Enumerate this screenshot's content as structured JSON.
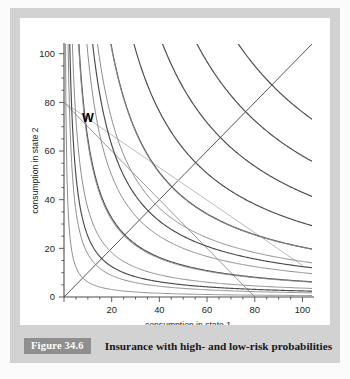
{
  "figure": {
    "caption_badge": "Figure 34.6",
    "caption_text": "Insurance with high- and low-risk probabilities",
    "badge_color": "#8f8f8f"
  },
  "chart_data": {
    "type": "line",
    "title": "",
    "xlabel": "consumption in state 1",
    "ylabel": "consumption in state 2",
    "xlim": [
      0,
      104
    ],
    "ylim": [
      0,
      104
    ],
    "xticks": [
      0,
      20,
      40,
      60,
      80,
      100
    ],
    "xtick_labels": [
      "",
      "20",
      "40",
      "60",
      "80",
      "100"
    ],
    "yticks": [
      0,
      20,
      40,
      60,
      80,
      100
    ],
    "ytick_labels": [
      "0",
      "20",
      "40",
      "60",
      "80",
      "100"
    ],
    "grid": false,
    "legend": false,
    "annotations": [
      {
        "text": "W",
        "x": 10,
        "y": 72,
        "label": "endowment-point-W"
      }
    ],
    "series": [
      {
        "name": "certainty-line-45deg",
        "type": "line",
        "color": "#555555",
        "width": 1.0,
        "points": [
          [
            0,
            0
          ],
          [
            104,
            104
          ]
        ]
      },
      {
        "name": "high-risk-budget-line",
        "type": "line",
        "color": "#9a9a9a",
        "width": 1.0,
        "points": [
          [
            0,
            80
          ],
          [
            80,
            0
          ]
        ]
      },
      {
        "name": "low-risk-budget-line",
        "type": "line",
        "color": "#bcbcbc",
        "width": 1.0,
        "points": [
          [
            0,
            80
          ],
          [
            100,
            13
          ]
        ]
      },
      {
        "name": "indifference-curve-dark-1",
        "type": "hyperbola",
        "color": "#4a4a4a",
        "width": 1.15,
        "k": 250,
        "slope": 1.0
      },
      {
        "name": "indifference-curve-dark-2",
        "type": "hyperbola",
        "color": "#4a4a4a",
        "width": 1.15,
        "k": 650,
        "slope": 1.0
      },
      {
        "name": "indifference-curve-dark-3",
        "type": "hyperbola",
        "color": "#4a4a4a",
        "width": 1.15,
        "k": 1250,
        "slope": 1.0
      },
      {
        "name": "indifference-curve-dark-4",
        "type": "hyperbola",
        "color": "#4a4a4a",
        "width": 1.15,
        "k": 2050,
        "slope": 1.0
      },
      {
        "name": "indifference-curve-dark-5",
        "type": "hyperbola",
        "color": "#4a4a4a",
        "width": 1.15,
        "k": 3050,
        "slope": 1.0
      },
      {
        "name": "indifference-curve-dark-6",
        "type": "hyperbola",
        "color": "#4a4a4a",
        "width": 1.15,
        "k": 4300,
        "slope": 1.0
      },
      {
        "name": "indifference-curve-dark-7",
        "type": "hyperbola",
        "color": "#4a4a4a",
        "width": 1.15,
        "k": 5800,
        "slope": 1.0
      },
      {
        "name": "indifference-curve-dark-8",
        "type": "hyperbola",
        "color": "#4a4a4a",
        "width": 1.15,
        "k": 7600,
        "slope": 1.0
      },
      {
        "name": "indifference-curve-light-1",
        "type": "hyperbola",
        "color": "#8d8d8d",
        "width": 1.0,
        "k": 160,
        "slope": 2.6
      },
      {
        "name": "indifference-curve-light-2",
        "type": "hyperbola",
        "color": "#8d8d8d",
        "width": 1.0,
        "k": 460,
        "slope": 2.6
      },
      {
        "name": "indifference-curve-light-3",
        "type": "hyperbola",
        "color": "#8d8d8d",
        "width": 1.0,
        "k": 950,
        "slope": 2.6
      },
      {
        "name": "indifference-curve-light-4",
        "type": "hyperbola",
        "color": "#8d8d8d",
        "width": 1.0,
        "k": 1650,
        "slope": 2.6
      },
      {
        "name": "indifference-curve-light-5",
        "type": "hyperbola",
        "color": "#8d8d8d",
        "width": 1.0,
        "k": 2600,
        "slope": 2.6
      },
      {
        "name": "indifference-curve-light-6",
        "type": "hyperbola",
        "color": "#8d8d8d",
        "width": 1.0,
        "k": 3800,
        "slope": 2.6
      },
      {
        "name": "indifference-curve-light-7",
        "type": "hyperbola",
        "color": "#8d8d8d",
        "width": 1.0,
        "k": 5300,
        "slope": 2.6
      }
    ]
  }
}
